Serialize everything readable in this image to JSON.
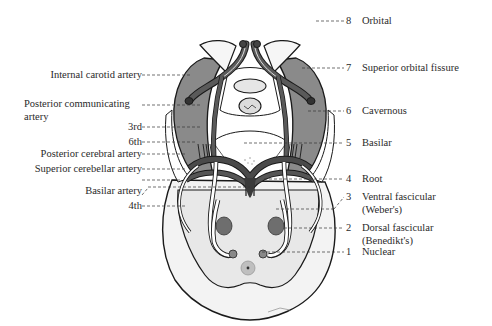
{
  "diagram": {
    "type": "anatomical-illustration",
    "colors": {
      "outline": "#1a1a1a",
      "artery": "#555555",
      "sinus": "#8a8a8a",
      "brainstem": "#ededed",
      "nucleus": "#777777",
      "leader": "#333333"
    },
    "left_labels": [
      {
        "id": "internal-carotid-artery",
        "text": "Internal carotid artery"
      },
      {
        "id": "posterior-communicating-artery-1",
        "text": "Posterior communicating"
      },
      {
        "id": "posterior-communicating-artery-2",
        "text": "artery"
      },
      {
        "id": "nerve-3rd",
        "text": "3rd"
      },
      {
        "id": "nerve-6th",
        "text": "6th"
      },
      {
        "id": "posterior-cerebral-artery",
        "text": "Posterior cerebral artery"
      },
      {
        "id": "superior-cerebellar-artery",
        "text": "Superior cerebellar artery"
      },
      {
        "id": "basilar-artery",
        "text": "Basilar artery"
      },
      {
        "id": "nerve-4th",
        "text": "4th"
      }
    ],
    "right_labels": [
      {
        "num": "8",
        "text": "Orbital",
        "text2": ""
      },
      {
        "num": "7",
        "text": "Superior orbital fissure",
        "text2": ""
      },
      {
        "num": "6",
        "text": "Cavernous",
        "text2": ""
      },
      {
        "num": "5",
        "text": "Basilar",
        "text2": ""
      },
      {
        "num": "4",
        "text": "Root",
        "text2": ""
      },
      {
        "num": "3",
        "text": "Ventral fascicular",
        "text2": "(Weber's)"
      },
      {
        "num": "2",
        "text": "Dorsal fascicular",
        "text2": "(Benedikt's)"
      },
      {
        "num": "1",
        "text": "Nuclear",
        "text2": ""
      }
    ]
  }
}
